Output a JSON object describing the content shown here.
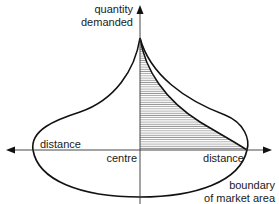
{
  "diagram": {
    "y_axis_label_line1": "quantity",
    "y_axis_label_line2": "demanded",
    "left_distance_label": "distance",
    "centre_label": "centre",
    "right_distance_label": "distance",
    "boundary_label_line1": "boundary",
    "boundary_label_line2": "of market area",
    "colors": {
      "line": "#111111",
      "hatch": "#555555",
      "background": "#ffffff"
    }
  }
}
